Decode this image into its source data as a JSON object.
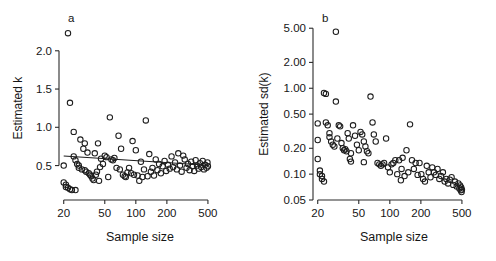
{
  "figure": {
    "background": "#ffffff",
    "marker_color": "#1d1d1d",
    "axis_color": "#2b2b2b",
    "line_color": "#1d1d1d"
  },
  "chart_data": [
    {
      "type": "scatter",
      "panel_letter": "a",
      "title": "",
      "xlabel": "Sample size",
      "ylabel": "Estimated k",
      "xscale": "log",
      "yscale": "linear",
      "xlim": [
        18,
        560
      ],
      "ylim": [
        0.05,
        2.35
      ],
      "xticks": [
        20,
        50,
        100,
        200,
        500
      ],
      "xticklabels": [
        "20",
        "50",
        "100",
        "200",
        "500"
      ],
      "yticks": [
        0.5,
        1.0,
        1.5,
        2.0
      ],
      "yticklabels": [
        "0.5",
        "1.0",
        "1.5",
        "2.0"
      ],
      "grid": false,
      "legend": "none",
      "fit_line": {
        "x": [
          20,
          500
        ],
        "y": [
          0.625,
          0.505
        ]
      },
      "x": [
        20,
        20,
        21,
        21,
        22,
        22,
        23,
        23,
        24,
        25,
        25,
        26,
        26,
        27,
        28,
        28,
        29,
        30,
        31,
        32,
        32,
        33,
        34,
        35,
        36,
        37,
        38,
        39,
        40,
        41,
        42,
        43,
        44,
        45,
        46,
        48,
        50,
        52,
        54,
        56,
        58,
        60,
        62,
        65,
        68,
        70,
        72,
        75,
        78,
        80,
        83,
        86,
        90,
        93,
        96,
        100,
        104,
        108,
        112,
        116,
        120,
        125,
        130,
        135,
        140,
        145,
        150,
        156,
        162,
        168,
        175,
        182,
        190,
        197,
        205,
        213,
        222,
        230,
        240,
        250,
        258,
        268,
        278,
        288,
        298,
        310,
        320,
        332,
        344,
        356,
        368,
        380,
        392,
        405,
        418,
        430,
        445,
        458,
        470,
        485,
        495,
        500
      ],
      "y": [
        0.5,
        0.28,
        0.25,
        0.22,
        0.21,
        2.23,
        0.19,
        1.32,
        0.18,
        0.94,
        0.62,
        0.57,
        0.18,
        0.52,
        0.5,
        0.47,
        0.84,
        0.45,
        0.72,
        0.79,
        0.44,
        0.42,
        0.67,
        0.4,
        0.38,
        0.36,
        0.33,
        0.31,
        0.66,
        0.38,
        0.42,
        0.79,
        0.3,
        0.48,
        0.59,
        0.52,
        0.63,
        0.61,
        0.35,
        1.13,
        0.58,
        0.57,
        0.6,
        0.47,
        0.89,
        0.45,
        0.72,
        0.38,
        0.36,
        0.35,
        0.41,
        0.47,
        0.4,
        0.82,
        0.38,
        0.7,
        0.37,
        0.3,
        0.55,
        0.35,
        0.45,
        1.09,
        0.36,
        0.65,
        0.42,
        0.47,
        0.37,
        0.58,
        0.44,
        0.52,
        0.4,
        0.49,
        0.56,
        0.43,
        0.51,
        0.46,
        0.62,
        0.48,
        0.54,
        0.45,
        0.66,
        0.5,
        0.42,
        0.63,
        0.58,
        0.47,
        0.52,
        0.44,
        0.55,
        0.49,
        0.43,
        0.57,
        0.5,
        0.46,
        0.53,
        0.48,
        0.56,
        0.45,
        0.51,
        0.47,
        0.54,
        0.49
      ]
    },
    {
      "type": "scatter",
      "panel_letter": "b",
      "title": "",
      "xlabel": "Sample size",
      "ylabel": "Estimated sd(k)",
      "xscale": "log",
      "yscale": "log",
      "xlim": [
        18,
        560
      ],
      "ylim": [
        0.05,
        5.6
      ],
      "xticks": [
        20,
        50,
        100,
        200,
        500
      ],
      "xticklabels": [
        "20",
        "50",
        "100",
        "200",
        "500"
      ],
      "yticks": [
        0.05,
        0.1,
        0.2,
        0.5,
        1.0,
        2.0,
        5.0
      ],
      "yticklabels": [
        "0.05",
        "0.10",
        "0.20",
        "0.50",
        "1.00",
        "2.00",
        "5.00"
      ],
      "grid": false,
      "legend": "none",
      "fit_line": null,
      "x": [
        20,
        20,
        20,
        21,
        21,
        22,
        22,
        23,
        23,
        24,
        24,
        25,
        26,
        26,
        27,
        28,
        29,
        30,
        31,
        32,
        33,
        34,
        35,
        36,
        37,
        38,
        39,
        40,
        41,
        42,
        44,
        46,
        48,
        50,
        52,
        54,
        56,
        58,
        60,
        62,
        65,
        68,
        70,
        73,
        76,
        79,
        82,
        85,
        88,
        92,
        96,
        100,
        104,
        108,
        113,
        118,
        123,
        128,
        133,
        139,
        145,
        151,
        157,
        164,
        171,
        178,
        186,
        194,
        202,
        210,
        219,
        228,
        238,
        248,
        258,
        268,
        279,
        290,
        302,
        314,
        327,
        340,
        353,
        367,
        382,
        397,
        412,
        428,
        445,
        462,
        472,
        480,
        487,
        492,
        496,
        500,
        30,
        42,
        56,
        130
      ],
      "y": [
        0.39,
        0.25,
        0.15,
        0.11,
        0.1,
        0.095,
        0.088,
        0.082,
        0.88,
        0.86,
        0.4,
        0.37,
        0.3,
        0.27,
        0.24,
        0.22,
        0.21,
        0.7,
        0.26,
        0.37,
        0.36,
        0.23,
        0.2,
        0.19,
        0.195,
        0.185,
        0.3,
        0.26,
        0.15,
        0.14,
        0.37,
        0.28,
        0.22,
        0.19,
        0.31,
        0.29,
        0.24,
        0.21,
        0.185,
        0.175,
        0.8,
        0.4,
        0.29,
        0.24,
        0.135,
        0.13,
        0.125,
        0.13,
        0.135,
        0.26,
        0.12,
        0.105,
        0.13,
        0.135,
        0.145,
        0.1,
        0.145,
        0.085,
        0.155,
        0.095,
        0.19,
        0.105,
        0.38,
        0.145,
        0.115,
        0.135,
        0.098,
        0.135,
        0.1,
        0.088,
        0.082,
        0.125,
        0.105,
        0.092,
        0.12,
        0.105,
        0.098,
        0.115,
        0.088,
        0.095,
        0.105,
        0.082,
        0.088,
        0.078,
        0.086,
        0.092,
        0.075,
        0.082,
        0.072,
        0.078,
        0.068,
        0.074,
        0.065,
        0.07,
        0.062,
        0.066,
        4.55,
        0.175,
        0.138,
        0.115
      ]
    }
  ]
}
